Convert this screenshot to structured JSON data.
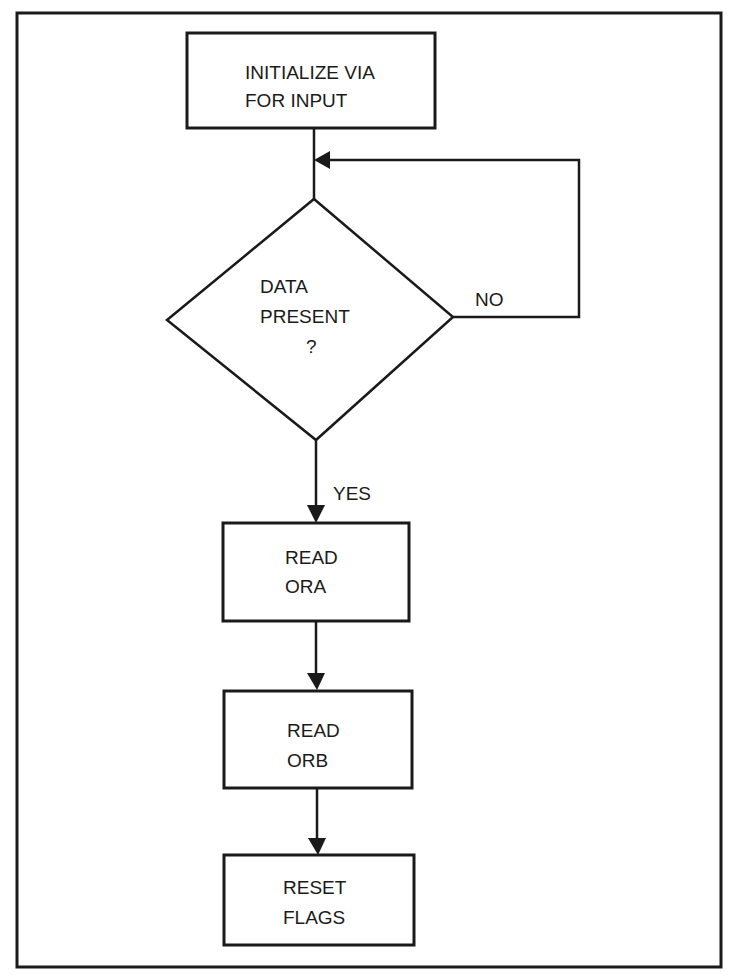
{
  "diagram": {
    "type": "flowchart",
    "colors": {
      "stroke": "#1a1a1a",
      "background": "#ffffff"
    },
    "nodes": [
      {
        "id": "init",
        "shape": "rectangle",
        "lines": [
          "INITIALIZE VIA",
          "FOR INPUT"
        ]
      },
      {
        "id": "decision",
        "shape": "diamond",
        "lines": [
          "DATA",
          "PRESENT",
          "?"
        ]
      },
      {
        "id": "read_ora",
        "shape": "rectangle",
        "lines": [
          "READ",
          "ORA"
        ]
      },
      {
        "id": "read_orb",
        "shape": "rectangle",
        "lines": [
          "READ",
          "ORB"
        ]
      },
      {
        "id": "reset",
        "shape": "rectangle",
        "lines": [
          "RESET",
          "FLAGS"
        ]
      }
    ],
    "edges": [
      {
        "from": "init",
        "to": "decision",
        "label": ""
      },
      {
        "from": "decision",
        "to": "decision",
        "label": "NO"
      },
      {
        "from": "decision",
        "to": "read_ora",
        "label": "YES"
      },
      {
        "from": "read_ora",
        "to": "read_orb",
        "label": ""
      },
      {
        "from": "read_orb",
        "to": "reset",
        "label": ""
      }
    ]
  }
}
